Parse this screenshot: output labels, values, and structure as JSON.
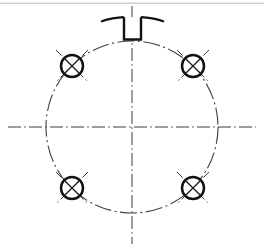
{
  "drawing": {
    "title": "Bolt Circle Hole Pattern with Top Keyway",
    "type": "engineering-drawing",
    "view": "plan-view",
    "background_color": "#ffffff",
    "line_colors": {
      "object_line": "#111116",
      "center_line": "#3c3c42",
      "pitch_circle": "#45454b",
      "scan_edge": "#b9b9bb"
    },
    "canvas": {
      "width": 264,
      "height": 247
    },
    "center": {
      "x": 132,
      "y": 127,
      "label": "part-center"
    },
    "pitch_circle": {
      "name": "bolt-circle",
      "cx": 132,
      "cy": 127,
      "r": 86,
      "linetype": "dash-dot"
    },
    "centerlines": [
      {
        "name": "horizontal-centerline",
        "orientation": "horizontal",
        "x1": 8,
        "y1": 127,
        "x2": 256,
        "y2": 127,
        "linetype": "dash-dot"
      },
      {
        "name": "vertical-centerline",
        "orientation": "vertical",
        "x1": 132,
        "y1": 6,
        "x2": 132,
        "y2": 244,
        "linetype": "dash-dot"
      }
    ],
    "holes": [
      {
        "name": "hole-upper-left",
        "position": "upper-left",
        "angle_deg": 135,
        "cx": 72,
        "cy": 66,
        "r": 11,
        "symbol": "cross-x",
        "axis_extension": 10
      },
      {
        "name": "hole-upper-right",
        "position": "upper-right",
        "angle_deg": 45,
        "cx": 193,
        "cy": 66,
        "r": 11,
        "symbol": "cross-x",
        "axis_extension": 10
      },
      {
        "name": "hole-lower-left",
        "position": "lower-left",
        "angle_deg": 225,
        "cx": 72,
        "cy": 188,
        "r": 11,
        "symbol": "cross-x",
        "axis_extension": 10
      },
      {
        "name": "hole-lower-right",
        "position": "lower-right",
        "angle_deg": 315,
        "cx": 193,
        "cy": 188,
        "r": 11,
        "symbol": "cross-x",
        "axis_extension": 10
      }
    ],
    "keyway": {
      "name": "top-keyway-slot",
      "shape": "rectangular-notch",
      "left_x": 124,
      "right_x": 141,
      "top_y": 18,
      "bottom_y": 40,
      "linetype": "continuous-thick"
    },
    "flange_edges": [
      {
        "name": "flange-edge-left",
        "x1": 103,
        "y1": 20,
        "x2": 124,
        "y2": 17
      },
      {
        "name": "flange-edge-right",
        "x1": 141,
        "y1": 17,
        "x2": 162,
        "y2": 20
      }
    ],
    "scan_edges": [
      {
        "name": "scan-edge-top",
        "x1": 0,
        "y1": 3,
        "x2": 264,
        "y2": 3
      }
    ],
    "hole_count": 4,
    "notes": ""
  }
}
